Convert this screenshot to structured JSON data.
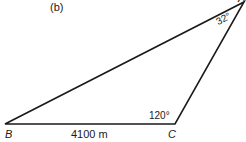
{
  "figure": {
    "panel_label": "(b)",
    "vertices": {
      "A": {
        "label": "A",
        "angle": "32°"
      },
      "B": {
        "label": "B"
      },
      "C": {
        "label": "C",
        "angle": "120°"
      }
    },
    "sides": {
      "BC": {
        "length": "4100 m"
      }
    },
    "line_color": "#1a1a1a"
  }
}
